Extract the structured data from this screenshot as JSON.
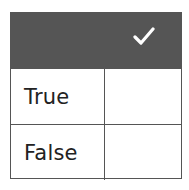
{
  "table": {
    "header": {
      "icon": "checkmark-icon",
      "background_color": "#555555",
      "icon_color": "#ffffff"
    },
    "rows": [
      {
        "label": "True",
        "answer": ""
      },
      {
        "label": "False",
        "answer": ""
      }
    ]
  }
}
